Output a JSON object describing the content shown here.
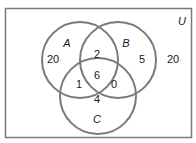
{
  "diagram": {
    "type": "venn-3",
    "universe_label": "U",
    "sets": [
      {
        "name": "A"
      },
      {
        "name": "B"
      },
      {
        "name": "C"
      }
    ],
    "regions": {
      "a_only": "20",
      "b_only": "5",
      "c_only": "4",
      "a_and_b_only": "2",
      "a_and_c_only": "1",
      "b_and_c_only": "0",
      "a_and_b_and_c": "6",
      "outside": "20"
    },
    "colors": {
      "stroke": "#7a7a7a",
      "text": "#1a1a1a",
      "background": "#ffffff"
    }
  }
}
